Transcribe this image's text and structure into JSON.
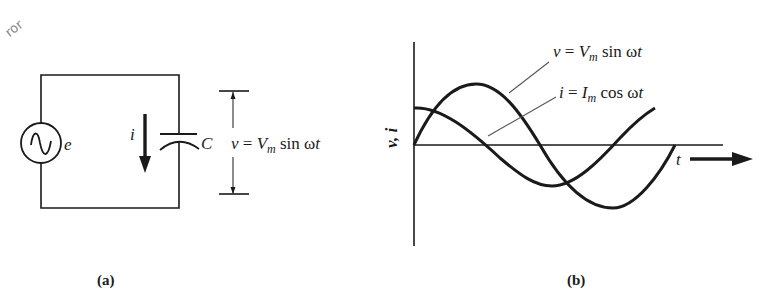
{
  "figure": {
    "panel_a": {
      "caption": "(a)",
      "source_label": "e",
      "current_label": "i",
      "capacitor_label": "C",
      "voltage_eq": {
        "lhs": "v",
        "eq": "=",
        "V": "V",
        "sub": "m",
        "rest": "sin ω",
        "t": "t"
      }
    },
    "panel_b": {
      "caption": "(b)",
      "y_axis_label": "v, i",
      "x_axis_label": "t",
      "curve_v_label": {
        "lhs": "v",
        "eq": "=",
        "V": "V",
        "sub": "m",
        "rest": "sin ω",
        "t": "t"
      },
      "curve_i_label": {
        "lhs": "i",
        "eq": "=",
        "V": "I",
        "sub": "m",
        "rest": "cos ω",
        "t": "t"
      }
    },
    "watermark": "ror"
  },
  "colors": {
    "ink": "#1a1a1a",
    "leader": "#555555",
    "watermark": "#8a8a8a"
  }
}
